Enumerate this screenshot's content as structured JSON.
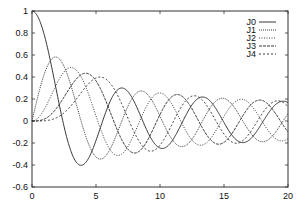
{
  "chart_data": {
    "type": "line",
    "title": "",
    "xlabel": "",
    "ylabel": "",
    "xlim": [
      0,
      20
    ],
    "ylim": [
      -0.6,
      1.0
    ],
    "x_ticks": [
      0,
      5,
      10,
      15,
      20
    ],
    "x_tick_labels": [
      "0",
      "5",
      "10",
      "15",
      "20"
    ],
    "y_ticks": [
      -0.6,
      -0.4,
      -0.2,
      0,
      0.2,
      0.4,
      0.6,
      0.8,
      1
    ],
    "y_tick_labels": [
      "-0.6",
      "-0.4",
      "-0.2",
      "0",
      "0.2",
      "0.4",
      "0.6",
      "0.8",
      "1"
    ],
    "grid": false,
    "legend_position": "upper right",
    "series": [
      {
        "name": "J0",
        "order": 0,
        "style": "solid",
        "first_max": [
          0,
          1.0
        ],
        "first_min": [
          3.83,
          -0.4
        ]
      },
      {
        "name": "J1",
        "order": 1,
        "style": "dotted",
        "first_max": [
          1.84,
          0.58
        ],
        "first_min": [
          5.33,
          -0.35
        ]
      },
      {
        "name": "J2",
        "order": 2,
        "style": "dotted",
        "first_max": [
          3.05,
          0.49
        ],
        "first_min": [
          6.71,
          -0.3
        ]
      },
      {
        "name": "J3",
        "order": 3,
        "style": "dashed",
        "first_max": [
          4.2,
          0.43
        ],
        "first_min": [
          8.02,
          -0.29
        ]
      },
      {
        "name": "J4",
        "order": 4,
        "style": "dashed",
        "first_max": [
          5.32,
          0.4
        ],
        "first_min": [
          9.28,
          -0.27
        ]
      }
    ]
  },
  "legend": {
    "items": [
      {
        "label": "J0",
        "dash": ""
      },
      {
        "label": "J1",
        "dash": "1,1"
      },
      {
        "label": "J2",
        "dash": "1,1.5"
      },
      {
        "label": "J3",
        "dash": "3,1"
      },
      {
        "label": "J4",
        "dash": "2,2"
      }
    ]
  },
  "colors": {
    "line": "#222222",
    "axis": "#333333"
  }
}
